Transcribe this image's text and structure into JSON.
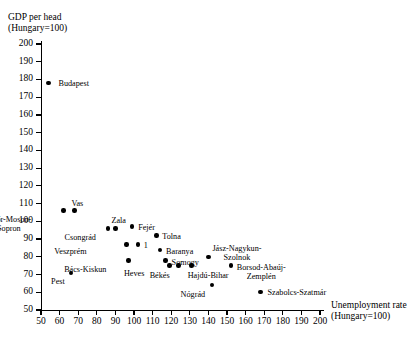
{
  "chart_data": {
    "type": "scatter",
    "title": "",
    "ylabel": "GDP per head\n(Hungary=100)",
    "xlabel": "Unemployment rate\n(Hungary=100)",
    "xlim": [
      50,
      200
    ],
    "ylim": [
      50,
      200
    ],
    "xticks": [
      50,
      60,
      70,
      80,
      90,
      100,
      110,
      120,
      130,
      140,
      150,
      160,
      170,
      180,
      190,
      200
    ],
    "yticks": [
      50,
      60,
      70,
      80,
      90,
      100,
      110,
      120,
      130,
      140,
      150,
      160,
      170,
      180,
      190,
      200
    ],
    "grid": false,
    "legend": "none",
    "points": [
      {
        "label": "Budapest",
        "x": 54,
        "y": 178,
        "lx": 10,
        "ly": -4
      },
      {
        "label": "Győr-Moson-\nSopron",
        "x": 62,
        "y": 106,
        "lx": -32,
        "ly": 4
      },
      {
        "label": "Vas",
        "x": 68,
        "y": 106,
        "lx": -3,
        "ly": -12
      },
      {
        "label": "Pest",
        "x": 66,
        "y": 71,
        "lx": -6,
        "ly": 4
      },
      {
        "label": "Csongrád",
        "x": 86,
        "y": 96,
        "lx": -12,
        "ly": 5
      },
      {
        "label": "Zala",
        "x": 90,
        "y": 96,
        "lx": -4,
        "ly": -12
      },
      {
        "label": "Fejér",
        "x": 99,
        "y": 97,
        "lx": 6,
        "ly": -4
      },
      {
        "label": "Veszprém",
        "x": 96,
        "y": 87,
        "lx": -40,
        "ly": 3
      },
      {
        "label": "1",
        "x": 102,
        "y": 87,
        "lx": 6,
        "ly": -3
      },
      {
        "label": "Bács-Kiskun",
        "x": 97,
        "y": 78,
        "lx": -22,
        "ly": 5
      },
      {
        "label": "Tolna",
        "x": 112,
        "y": 92,
        "lx": 6,
        "ly": -4
      },
      {
        "label": "Baranya",
        "x": 114,
        "y": 84,
        "lx": 6,
        "ly": -3
      },
      {
        "label": "Somogy",
        "x": 117,
        "y": 78,
        "lx": 6,
        "ly": -2
      },
      {
        "label": "Heves",
        "x": 119,
        "y": 75,
        "lx": -25,
        "ly": 3
      },
      {
        "label": "Békés",
        "x": 124,
        "y": 75,
        "lx": -9,
        "ly": 5
      },
      {
        "label": "Hajdú-Bihar",
        "x": 131,
        "y": 75,
        "lx": -4,
        "ly": 5
      },
      {
        "label": "Jász-Nagykun-\nSzolnok",
        "x": 140,
        "y": 80,
        "lx": 4,
        "ly": -13
      },
      {
        "label": "Borsod-Abaúj-\nZemplén",
        "x": 152,
        "y": 75,
        "lx": 6,
        "ly": -3
      },
      {
        "label": "Nógrád",
        "x": 142,
        "y": 64,
        "lx": -7,
        "ly": 5
      },
      {
        "label": "Szabolcs-Szatmár",
        "x": 168,
        "y": 60,
        "lx": 7,
        "ly": -4
      }
    ]
  }
}
